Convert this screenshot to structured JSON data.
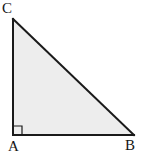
{
  "figure": {
    "kind": "right-triangle-diagram",
    "background_color": "#ffffff",
    "fill_color": "#ededed",
    "stroke_color": "#1a1a1a",
    "stroke_width": 2,
    "vertices": [
      {
        "name": "C",
        "label": "C",
        "x": 13,
        "y": 19,
        "angle_type": "acute"
      },
      {
        "name": "A",
        "label": "A",
        "x": 13,
        "y": 135,
        "angle_type": "right"
      },
      {
        "name": "B",
        "label": "B",
        "x": 134,
        "y": 135,
        "angle_type": "acute"
      }
    ],
    "edges": [
      {
        "name": "leg-vertical",
        "from": "C",
        "to": "A"
      },
      {
        "name": "leg-horizontal",
        "from": "A",
        "to": "B"
      },
      {
        "name": "hypotenuse",
        "from": "B",
        "to": "C"
      }
    ],
    "right_angle_marker": {
      "at_vertex": "A",
      "size": 9,
      "x": 13,
      "y": 126,
      "stroke_color": "#1a1a1a",
      "stroke_width": 1
    },
    "labels": {
      "C": "C",
      "A": "A",
      "B": "B"
    }
  }
}
